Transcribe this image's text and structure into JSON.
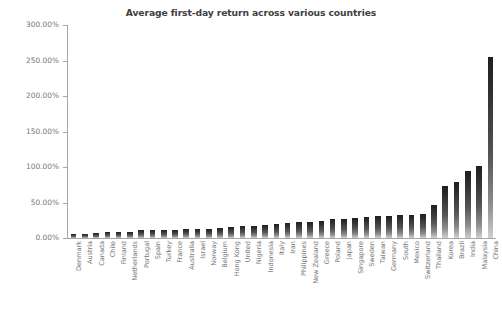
{
  "chart_data": {
    "type": "bar",
    "title": "Average first-day return across various countries",
    "xlabel": "",
    "ylabel": "",
    "ylim": [
      0,
      300
    ],
    "ytick_labels": [
      "0.00%",
      "50.00%",
      "100.00%",
      "150.00%",
      "200.00%",
      "250.00%",
      "300.00%"
    ],
    "ytick_values": [
      0,
      50,
      100,
      150,
      200,
      250,
      300
    ],
    "grid": false,
    "legend": null,
    "value_unit": "percent",
    "categories": [
      "Denmark",
      "Austria",
      "Canada",
      "Chile",
      "Finland",
      "Netherlands",
      "Portugal",
      "Spain",
      "Turkey",
      "France",
      "Australia",
      "Israel",
      "Norway",
      "Belgium",
      "Hong Kong",
      "United",
      "Nigeria",
      "Indonesia",
      "Italy",
      "Iran",
      "Philippines",
      "New Zealand",
      "Greece",
      "Poland",
      "Japan",
      "Singapore",
      "Sweden",
      "Taiwan",
      "Germany",
      "South",
      "Mexico",
      "Switzerland",
      "Thailand",
      "Korea",
      "Brazil",
      "India",
      "Malaysia",
      "China"
    ],
    "values": [
      5.4,
      6.3,
      6.5,
      8.4,
      8.6,
      8.8,
      11.6,
      10.9,
      10.8,
      11.6,
      12.1,
      12.1,
      12.3,
      13.5,
      15.8,
      16.9,
      17.4,
      19.0,
      20.3,
      21.6,
      22.1,
      23.2,
      24.6,
      26.3,
      27.0,
      28.2,
      29.7,
      31.1,
      30.9,
      31.8,
      31.9,
      34.4,
      46.7,
      73.2,
      78.3,
      95.0,
      102.1,
      255.0
    ],
    "series_name": "Average first-day return",
    "bar_fill": {
      "gradient": true,
      "top_color": "#1f1f1f",
      "bottom_color": "#cfcfcf"
    }
  },
  "axis": {
    "axis_color": "#a6a6a6",
    "tick_label_color": "#767676",
    "title_color": "#404040"
  }
}
